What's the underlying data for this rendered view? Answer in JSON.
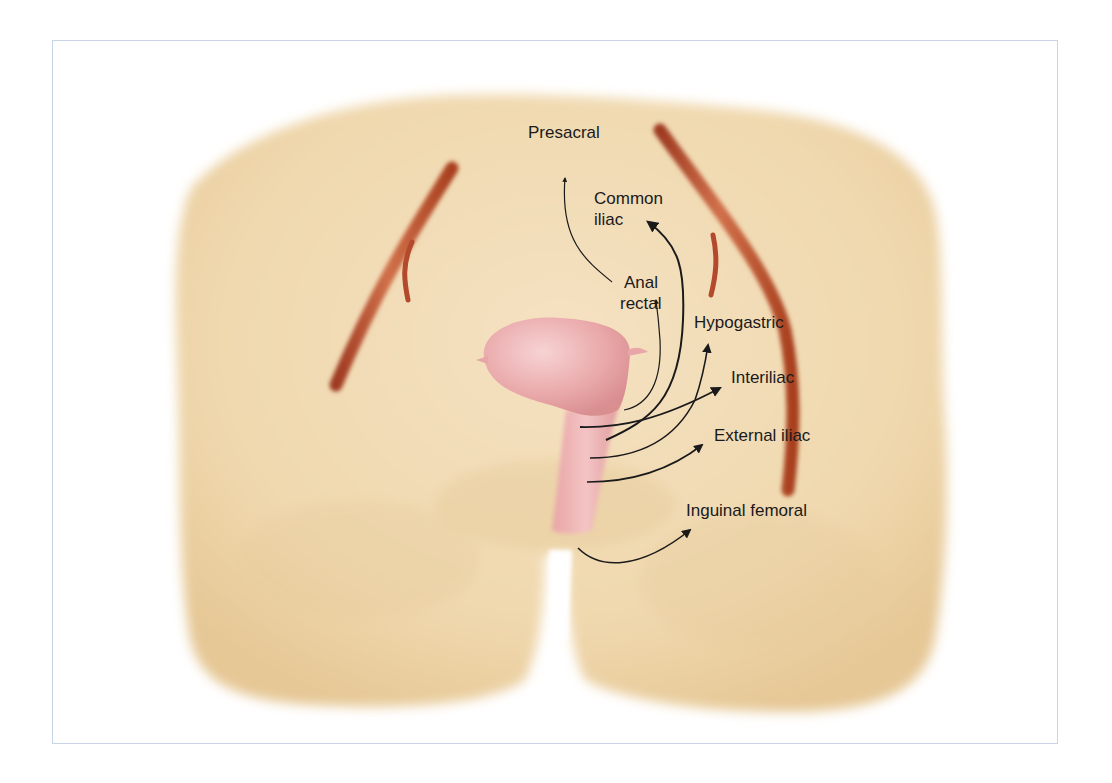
{
  "figure": {
    "colors": {
      "frame_border": "#c9d3e6",
      "skin": "#f1dbb4",
      "skin_shadow": "#e3c592",
      "artery": "#b8462a",
      "organ": "#e8a6a8",
      "arrow": "#1a1a1a",
      "text": "#1a1a1a"
    },
    "labels": {
      "presacral": "Presacral",
      "common_iliac_line1": "Common",
      "common_iliac_line2": "iliac",
      "anal_rectal_line1": "Anal",
      "anal_rectal_line2": "rectal",
      "hypogastric": "Hypogastric",
      "interiliac": "Interiliac",
      "external_iliac": "External iliac",
      "inguinal_femoral": "Inguinal femoral"
    }
  }
}
